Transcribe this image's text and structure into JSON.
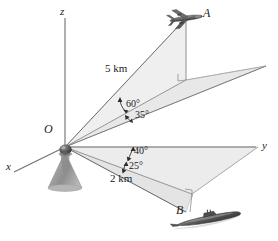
{
  "figure": {
    "background_color": "#ffffff",
    "line_color": "#6b6b6b",
    "plane_fill": "#efefef",
    "plane_stroke": "#c8c8c8",
    "text_color": "#1b1b1b"
  },
  "axes": [
    {
      "name": "x-axis",
      "label": "x",
      "x": 6,
      "y": 167
    },
    {
      "name": "y-axis",
      "label": "y",
      "x": 262,
      "y": 147
    },
    {
      "name": "z-axis",
      "label": "z",
      "x": 62,
      "y": 13
    }
  ],
  "points": [
    {
      "name": "origin",
      "label": "O",
      "x": 48,
      "y": 130
    },
    {
      "name": "airplane",
      "label": "A",
      "x": 204,
      "y": 14
    },
    {
      "name": "submarine",
      "label": "B",
      "x": 178,
      "y": 211
    }
  ],
  "dimensions": [
    {
      "name": "range-to-airplane",
      "label": "5 km",
      "x": 107,
      "y": 70
    },
    {
      "name": "range-to-submarine",
      "label": "2 km",
      "x": 112,
      "y": 179
    }
  ],
  "angles": [
    {
      "name": "elevation-angle-airplane",
      "label": "60°",
      "x": 126,
      "y": 105
    },
    {
      "name": "azimuth-angle-airplane",
      "label": "35°",
      "x": 135,
      "y": 116
    },
    {
      "name": "azimuth-angle-submarine",
      "label": "40°",
      "x": 134,
      "y": 152
    },
    {
      "name": "depression-angle-submarine",
      "label": "25°",
      "x": 130,
      "y": 167
    }
  ],
  "objects": [
    {
      "name": "radar-station-icon",
      "description": "conical radar station at origin"
    },
    {
      "name": "airplane-icon",
      "description": "airplane silhouette at point A"
    },
    {
      "name": "submarine-icon",
      "description": "submarine silhouette at point B"
    }
  ],
  "right_angle_marks": [
    {
      "name": "right-angle-upper-plane"
    },
    {
      "name": "right-angle-lower-plane"
    }
  ]
}
